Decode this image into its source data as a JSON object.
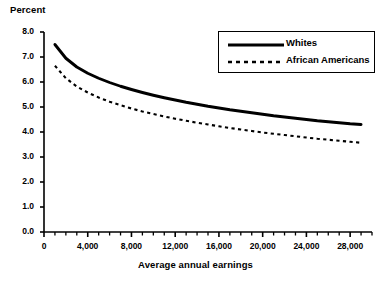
{
  "chart_data": {
    "type": "line",
    "title": "",
    "ylabel": "Percent",
    "xlabel": "Average annual earnings",
    "xlim": [
      0,
      30000
    ],
    "ylim": [
      0,
      8
    ],
    "grid": false,
    "legend_position": "top-right",
    "y_ticks": [
      "0.0",
      "1.0",
      "2.0",
      "3.0",
      "4.0",
      "5.0",
      "6.0",
      "7.0",
      "8.0"
    ],
    "y_tick_values": [
      0,
      1,
      2,
      3,
      4,
      5,
      6,
      7,
      8
    ],
    "x_ticks": [
      "0",
      "4,000",
      "8,000",
      "12,000",
      "16,000",
      "20,000",
      "24,000",
      "28,000"
    ],
    "x_tick_values": [
      0,
      4000,
      8000,
      12000,
      16000,
      20000,
      24000,
      28000
    ],
    "x_minor_tick_interval": 1000,
    "x": [
      1000,
      2000,
      3000,
      4000,
      5000,
      6000,
      7000,
      8000,
      9000,
      10000,
      11000,
      12000,
      13000,
      14000,
      15000,
      16000,
      17000,
      18000,
      19000,
      20000,
      21000,
      22000,
      23000,
      24000,
      25000,
      26000,
      27000,
      28000,
      29000
    ],
    "series": [
      {
        "name": "Whites",
        "style": "solid",
        "color": "#000000",
        "values": [
          7.5,
          6.95,
          6.6,
          6.35,
          6.15,
          5.98,
          5.83,
          5.7,
          5.58,
          5.47,
          5.37,
          5.28,
          5.19,
          5.11,
          5.03,
          4.96,
          4.89,
          4.83,
          4.77,
          4.71,
          4.65,
          4.6,
          4.55,
          4.5,
          4.45,
          4.41,
          4.37,
          4.33,
          4.3
        ]
      },
      {
        "name": "African Americans",
        "style": "dashed",
        "color": "#000000",
        "values": [
          6.65,
          6.15,
          5.82,
          5.58,
          5.38,
          5.21,
          5.07,
          4.94,
          4.82,
          4.72,
          4.62,
          4.53,
          4.45,
          4.37,
          4.3,
          4.23,
          4.16,
          4.1,
          4.04,
          3.98,
          3.93,
          3.88,
          3.83,
          3.78,
          3.73,
          3.69,
          3.65,
          3.61,
          3.57
        ]
      }
    ]
  },
  "legend": {
    "whites_label": "Whites",
    "african_americans_label": "African Americans"
  },
  "axes": {
    "y_title": "Percent",
    "x_title": "Average annual earnings"
  }
}
